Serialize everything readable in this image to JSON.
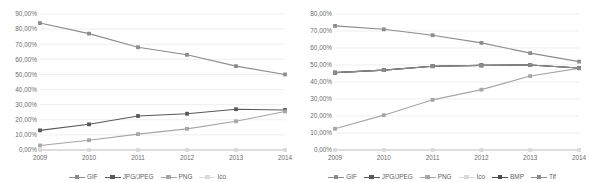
{
  "charts": [
    {
      "id": "chart-left",
      "title": "",
      "x": [
        "2009",
        "2010",
        "2011",
        "2012",
        "2013",
        "2014"
      ],
      "yticks": [
        "0,00%",
        "10,00%",
        "20,00%",
        "30,00%",
        "40,00%",
        "50,00%",
        "60,00%",
        "70,00%",
        "80,00%",
        "90,00%"
      ],
      "ylim": [
        0,
        90
      ],
      "ystep": 10,
      "legend": [
        "GIF",
        "JPG/JPEG",
        "PNG",
        "Ico"
      ],
      "colors": [
        "#8c8c8c",
        "#595959",
        "#a6a6a6",
        "#d9d9d9"
      ],
      "markers": [
        "square",
        "square",
        "square",
        "square"
      ],
      "chart_data": {
        "type": "line",
        "title": "",
        "xlabel": "",
        "ylabel": "",
        "ylim": [
          0,
          90
        ],
        "grid": true,
        "legend_position": "bottom",
        "categories": [
          "2009",
          "2010",
          "2011",
          "2012",
          "2013",
          "2014"
        ],
        "series": [
          {
            "name": "GIF",
            "values": [
              84.0,
              77.0,
              68.0,
              63.0,
              55.5,
              50.0
            ]
          },
          {
            "name": "JPG/JPEG",
            "values": [
              13.0,
              17.0,
              22.5,
              24.0,
              27.0,
              26.5
            ]
          },
          {
            "name": "PNG",
            "values": [
              3.0,
              6.5,
              10.5,
              14.0,
              19.0,
              25.5
            ]
          },
          {
            "name": "Ico",
            "values": [
              0.0,
              0.0,
              0.0,
              0.0,
              0.0,
              0.0
            ]
          }
        ]
      }
    },
    {
      "id": "chart-right",
      "title": "",
      "x": [
        "2009",
        "2010",
        "2011",
        "2012",
        "2013",
        "2014"
      ],
      "yticks": [
        "0,00%",
        "10,00%",
        "20,00%",
        "30,00%",
        "40,00%",
        "50,00%",
        "60,00%",
        "70,00%",
        "80,00%"
      ],
      "ylim": [
        0,
        80
      ],
      "ystep": 10,
      "legend": [
        "GIF",
        "JPG/JPEG",
        "PNG",
        "Ico",
        "BMP",
        "Tif"
      ],
      "colors": [
        "#8c8c8c",
        "#595959",
        "#a6a6a6",
        "#d9d9d9",
        "#4d4d4d",
        "#8c8c8c"
      ],
      "markers": [
        "square",
        "square",
        "square",
        "square",
        "square",
        "square"
      ],
      "chart_data": {
        "type": "line",
        "title": "",
        "xlabel": "",
        "ylabel": "",
        "ylim": [
          0,
          80
        ],
        "grid": true,
        "legend_position": "bottom",
        "categories": [
          "2009",
          "2010",
          "2011",
          "2012",
          "2013",
          "2014"
        ],
        "series": [
          {
            "name": "GIF",
            "values": [
              73.0,
              71.0,
              67.5,
              63.0,
              57.0,
              52.0
            ]
          },
          {
            "name": "JPG/JPEG",
            "values": [
              45.5,
              47.0,
              49.3,
              49.8,
              50.0,
              48.2
            ]
          },
          {
            "name": "PNG",
            "values": [
              12.5,
              20.5,
              29.5,
              35.5,
              43.5,
              48.0
            ]
          },
          {
            "name": "Ico",
            "values": [
              0.0,
              0.0,
              0.0,
              0.0,
              0.0,
              0.0
            ]
          },
          {
            "name": "BMP",
            "values": [
              45.5,
              47.0,
              49.3,
              49.8,
              50.0,
              48.2
            ]
          },
          {
            "name": "Tif",
            "values": [
              45.5,
              47.0,
              49.3,
              49.8,
              50.0,
              48.2
            ]
          }
        ]
      }
    }
  ]
}
